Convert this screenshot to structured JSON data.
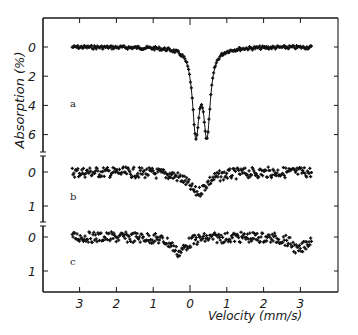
{
  "chart_data": {
    "type": "scatter",
    "title": "",
    "xlabel": "Velocity (mm/s)",
    "ylabel": "Absorption (%)",
    "xlim": [
      -4.1,
      4.0
    ],
    "x_ticks": [
      -3,
      -2,
      -1,
      0,
      1,
      2,
      3
    ],
    "x_tick_labels": [
      "3",
      "2",
      "1",
      "0",
      "1",
      "2",
      "3"
    ],
    "grid": false,
    "legend": null,
    "data_range_x": [
      -3.2,
      3.3
    ],
    "panels": [
      {
        "label": "a",
        "y_ticks": [
          0,
          2,
          4,
          6
        ],
        "y_tick_labels": [
          "0",
          "2",
          "4",
          "6"
        ],
        "ylim_inverted": [
          -2.0,
          7.4
        ],
        "fit_line": true,
        "features": [
          {
            "type": "baseline",
            "value": 0.0
          },
          {
            "type": "doublet",
            "peak1_velocity": 0.16,
            "peak1_absorption": 6.9,
            "peak2_velocity": 0.46,
            "peak2_absorption": 6.9,
            "midpoint_absorption": 4.5,
            "hwhm": 0.11
          }
        ],
        "noise": 0.12
      },
      {
        "label": "b",
        "y_ticks": [
          0,
          1
        ],
        "y_tick_labels": [
          "0",
          "1"
        ],
        "ylim_inverted": [
          -0.5,
          1.5
        ],
        "fit_line": false,
        "features": [
          {
            "type": "baseline",
            "value": 0.0
          },
          {
            "type": "singlet",
            "velocity": 0.2,
            "absorption": 0.6,
            "hwhm": 0.3
          }
        ],
        "noise": 0.12
      },
      {
        "label": "c",
        "y_ticks": [
          0,
          1
        ],
        "y_tick_labels": [
          "0",
          "1"
        ],
        "ylim_inverted": [
          -0.5,
          1.5
        ],
        "fit_line": false,
        "features": [
          {
            "type": "baseline",
            "value": 0.0
          },
          {
            "type": "singlet",
            "velocity": -0.3,
            "absorption": 0.45,
            "hwhm": 0.22
          },
          {
            "type": "singlet",
            "velocity": 2.95,
            "absorption": 0.4,
            "hwhm": 0.2
          }
        ],
        "noise": 0.12
      }
    ]
  },
  "axes": {
    "ylabel": "Absorption (%)",
    "xlabel": "Velocity (mm/s)"
  }
}
